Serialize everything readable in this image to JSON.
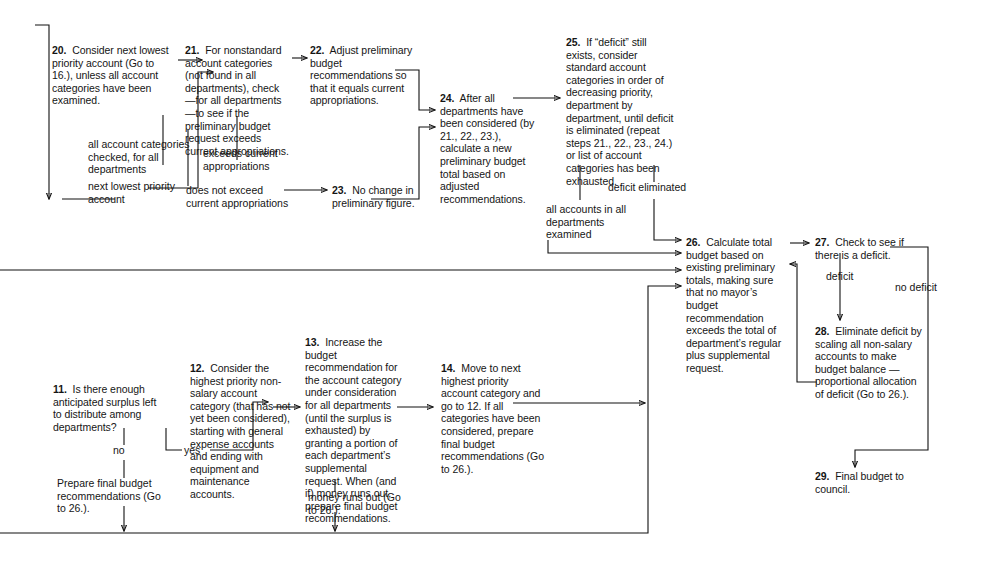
{
  "diagram": {
    "nodes": [
      {
        "id": "n20",
        "num": "20.",
        "text": "  Consider next lowest priority account (Go to 16.), unless all account categories have been examined."
      },
      {
        "id": "n21",
        "num": "21.",
        "text": "  For nonstandard account categories (not found in all departments), check—for all departments—to see if the preliminary budget request exceeds current appropriations."
      },
      {
        "id": "n22",
        "num": "22.",
        "text": "  Adjust preliminary budget recommendations so that it equals current appropriations."
      },
      {
        "id": "n23",
        "num": "23.",
        "text": "  No change in preliminary figure."
      },
      {
        "id": "n24",
        "num": "24.",
        "text": "  After all departments have been considered (by 21., 22., 23.), calculate a new preliminary budget total based on adjusted recommendations."
      },
      {
        "id": "n25",
        "num": "25.",
        "text": "  If “deficit” still exists, consider standard account categories in order of decreasing priority, department by department, until deficit is eliminated (repeat steps 21., 22., 23., 24.) or list of account categories has been exhausted."
      },
      {
        "id": "n26",
        "num": "26.",
        "text": "  Calculate total budget based on existing preliminary totals, making sure that no mayor’s budget recommendation exceeds the total of department’s regular plus supplemental request."
      },
      {
        "id": "n27",
        "num": "27.",
        "text": "  Check to see if there is a deficit."
      },
      {
        "id": "n28",
        "num": "28.",
        "text": "  Eliminate deficit by scaling all non-salary accounts to make budget balance —proportional allocation of deficit (Go to 26.)."
      },
      {
        "id": "n29",
        "num": "29.",
        "text": "  Final budget to council."
      },
      {
        "id": "n11",
        "num": "11.",
        "text": "  Is there enough anticipated surplus left to distribute among departments?"
      },
      {
        "id": "n12",
        "num": "12.",
        "text": "  Consider the highest priority non-salary account category (that has not yet been considered), starting with general expense accounts and ending with equipment and maintenance accounts."
      },
      {
        "id": "n13",
        "num": "13.",
        "text": "  Increase the budget recommendation for the account category under consideration for all departments (until the surplus is exhausted) by granting a portion of each department’s supplemental request. When (and if) money runs out, prepare final budget recommendations."
      },
      {
        "id": "n14",
        "num": "14.",
        "text": "  Move to next highest priority account category and go to 12. If all categories have been considered, prepare final budget recommendations (Go to 26.)."
      }
    ],
    "edge_labels": [
      {
        "id": "l20a",
        "text": "all account categories checked, for all departments"
      },
      {
        "id": "l20b",
        "text": "next lowest priority account"
      },
      {
        "id": "l21a",
        "text": "exceeds current appropriations"
      },
      {
        "id": "l21b",
        "text": "does not exceed current appropriations"
      },
      {
        "id": "l25a",
        "text": "all accounts in all departments examined"
      },
      {
        "id": "l25b",
        "text": "deficit eliminated"
      },
      {
        "id": "l27a",
        "text": "deficit"
      },
      {
        "id": "l27b",
        "text": "no deficit"
      },
      {
        "id": "l11no",
        "text": "no"
      },
      {
        "id": "l11yes",
        "text": "yes"
      },
      {
        "id": "l11prep",
        "text": "Prepare final budget recommendations (Go to 26.)."
      },
      {
        "id": "l13out",
        "text": "money runs out (Go to 26.)."
      }
    ],
    "colors": {
      "line": "#111111",
      "text": "#151515",
      "background": "#ffffff"
    }
  }
}
